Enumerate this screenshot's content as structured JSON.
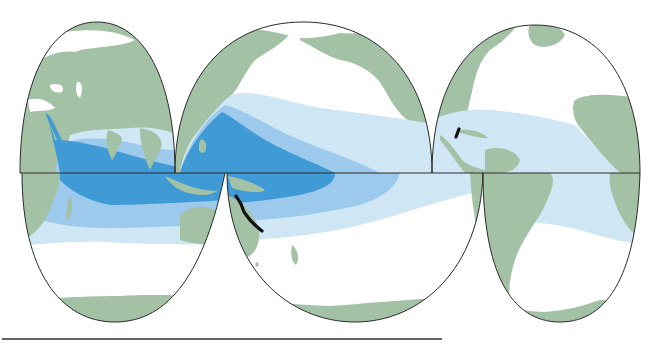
{
  "map": {
    "projection": "interrupted world map",
    "colors": {
      "land": "#a3c2a5",
      "ocean": "#ffffff",
      "zone_outer": "#cfe6f4",
      "zone_middle": "#9cc9ec",
      "zone_inner": "#3f9ad6",
      "marker": "#111111",
      "outline": "#2a2a2a"
    },
    "zones": [
      {
        "name": "outer-zone",
        "level": 1
      },
      {
        "name": "middle-zone",
        "level": 2
      },
      {
        "name": "inner-zone",
        "level": 3
      }
    ],
    "markers": [
      {
        "name": "great-barrier-reef-marker"
      },
      {
        "name": "belize-reef-marker"
      }
    ]
  }
}
